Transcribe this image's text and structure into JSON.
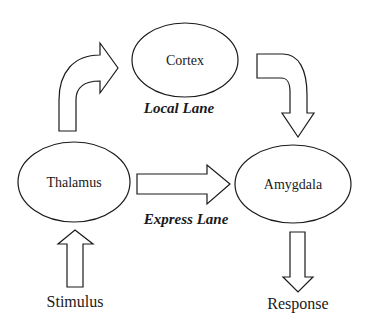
{
  "diagram": {
    "nodes": {
      "cortex": {
        "label": "Cortex"
      },
      "thalamus": {
        "label": "Thalamus"
      },
      "amygdala": {
        "label": "Amygdala"
      }
    },
    "lanes": {
      "local": {
        "label": "Local Lane"
      },
      "express": {
        "label": "Express Lane"
      }
    },
    "input": {
      "label": "Stimulus"
    },
    "output": {
      "label": "Response"
    },
    "edges": [
      {
        "from": "Stimulus",
        "to": "Thalamus",
        "style": "block-arrow-up"
      },
      {
        "from": "Thalamus",
        "to": "Cortex",
        "style": "curved-block-arrow",
        "lane": "Local Lane"
      },
      {
        "from": "Cortex",
        "to": "Amygdala",
        "style": "curved-block-arrow",
        "lane": "Local Lane"
      },
      {
        "from": "Thalamus",
        "to": "Amygdala",
        "style": "block-arrow-right",
        "lane": "Express Lane"
      },
      {
        "from": "Amygdala",
        "to": "Response",
        "style": "block-arrow-down"
      }
    ]
  }
}
